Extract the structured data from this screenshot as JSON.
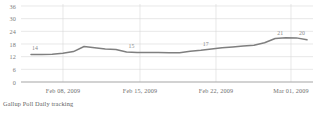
{
  "caption": "Gallup Poll Daily tracking",
  "chart_data": {
    "type": "line",
    "title": "",
    "subtitle": "",
    "xlabel": "",
    "ylabel": "",
    "ylim": [
      0,
      36
    ],
    "yticks": [
      36,
      30,
      24,
      18,
      12,
      6,
      0
    ],
    "grid": true,
    "legend": "none",
    "categories": [
      "Feb 08, 2009",
      "Feb 15, 2009",
      "Feb 22, 2009",
      "Mar 01, 2009"
    ],
    "xtick_labels": [
      "Feb 08, 2009",
      "Feb 15, 2009",
      "Feb 22, 2009",
      "Mar 01, 2009"
    ],
    "series": [
      {
        "name": "Gallup Poll Daily tracking",
        "color": "#7f7f7f",
        "x": [
          0,
          1,
          2,
          3,
          4,
          5,
          6,
          7,
          8,
          9,
          10,
          11,
          12,
          13,
          14,
          15,
          16,
          17,
          18,
          19,
          20,
          21,
          22,
          23,
          24,
          25,
          26
        ],
        "values": [
          13,
          13,
          13.2,
          13.6,
          14.4,
          16.8,
          16.2,
          15.6,
          15.4,
          14.2,
          14.0,
          14.0,
          14.0,
          13.8,
          13.9,
          14.6,
          15.0,
          15.6,
          16.2,
          16.6,
          17.0,
          17.4,
          18.6,
          20.6,
          21.0,
          20.9,
          20.0
        ]
      }
    ],
    "point_labels": [
      {
        "text": "14",
        "x": 0,
        "value": 14
      },
      {
        "text": "15",
        "x": 9,
        "value": 15
      },
      {
        "text": "17",
        "x": 16,
        "value": 17
      },
      {
        "text": "21",
        "x": 23,
        "value": 21
      },
      {
        "text": "20",
        "x": 26,
        "value": 20
      }
    ],
    "axis_colors": {
      "gridline": "#d8d8d8",
      "axis": "#9a9a9a",
      "line": "#7f7f7f",
      "text": "#6f6f6f"
    }
  }
}
